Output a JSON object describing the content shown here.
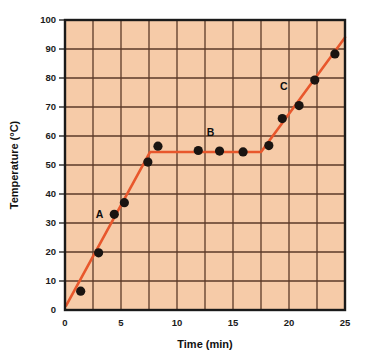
{
  "chart_data": {
    "type": "line",
    "title": "",
    "xlabel": "Time (min)",
    "ylabel": "Temperature (°C)",
    "xlim": [
      0,
      25
    ],
    "ylim": [
      0,
      100
    ],
    "x_ticks": [
      0,
      5,
      10,
      15,
      20,
      25
    ],
    "x_tick_labels": [
      "0",
      "5",
      "10",
      "15",
      "20",
      "25"
    ],
    "x_gridline_step": 2.5,
    "y_ticks": [
      0,
      10,
      20,
      30,
      40,
      50,
      60,
      70,
      80,
      90,
      100
    ],
    "y_tick_labels": [
      "0",
      "10",
      "20",
      "30",
      "40",
      "50",
      "60",
      "70",
      "80",
      "90",
      "100"
    ],
    "y_gridline_step": 10,
    "grid": true,
    "legend": "none",
    "plot_background": "#F6CBA8",
    "grid_color": "#5B3A28",
    "frame_color": "#1a1a1a",
    "line_color": "#E8572C",
    "marker_color": "#1a1411",
    "series": [
      {
        "name": "Heating curve",
        "marker": "filled-circle",
        "points": [
          {
            "x": 1.4,
            "y": 6.5
          },
          {
            "x": 3.0,
            "y": 19.7
          },
          {
            "x": 4.4,
            "y": 33.0
          },
          {
            "x": 5.3,
            "y": 37.0
          },
          {
            "x": 7.4,
            "y": 51.0
          },
          {
            "x": 8.3,
            "y": 56.5
          },
          {
            "x": 11.9,
            "y": 55.0
          },
          {
            "x": 13.8,
            "y": 54.8
          },
          {
            "x": 15.9,
            "y": 54.5
          },
          {
            "x": 18.2,
            "y": 56.7
          },
          {
            "x": 19.4,
            "y": 66.0
          },
          {
            "x": 20.9,
            "y": 70.5
          },
          {
            "x": 22.3,
            "y": 79.3
          },
          {
            "x": 24.1,
            "y": 88.3
          }
        ]
      }
    ],
    "fit_line_vertices": [
      {
        "x": 0.1,
        "y": 1.5
      },
      {
        "x": 7.6,
        "y": 54.5
      },
      {
        "x": 17.5,
        "y": 54.5
      },
      {
        "x": 25.0,
        "y": 94.0
      }
    ],
    "annotations": [
      {
        "label": "A",
        "x": 4.4,
        "y": 33.0,
        "position": "left"
      },
      {
        "label": "B",
        "x": 13.0,
        "y": 58.5,
        "position": "above"
      },
      {
        "label": "C",
        "x": 20.4,
        "y": 74.5,
        "position": "above-left"
      }
    ]
  }
}
